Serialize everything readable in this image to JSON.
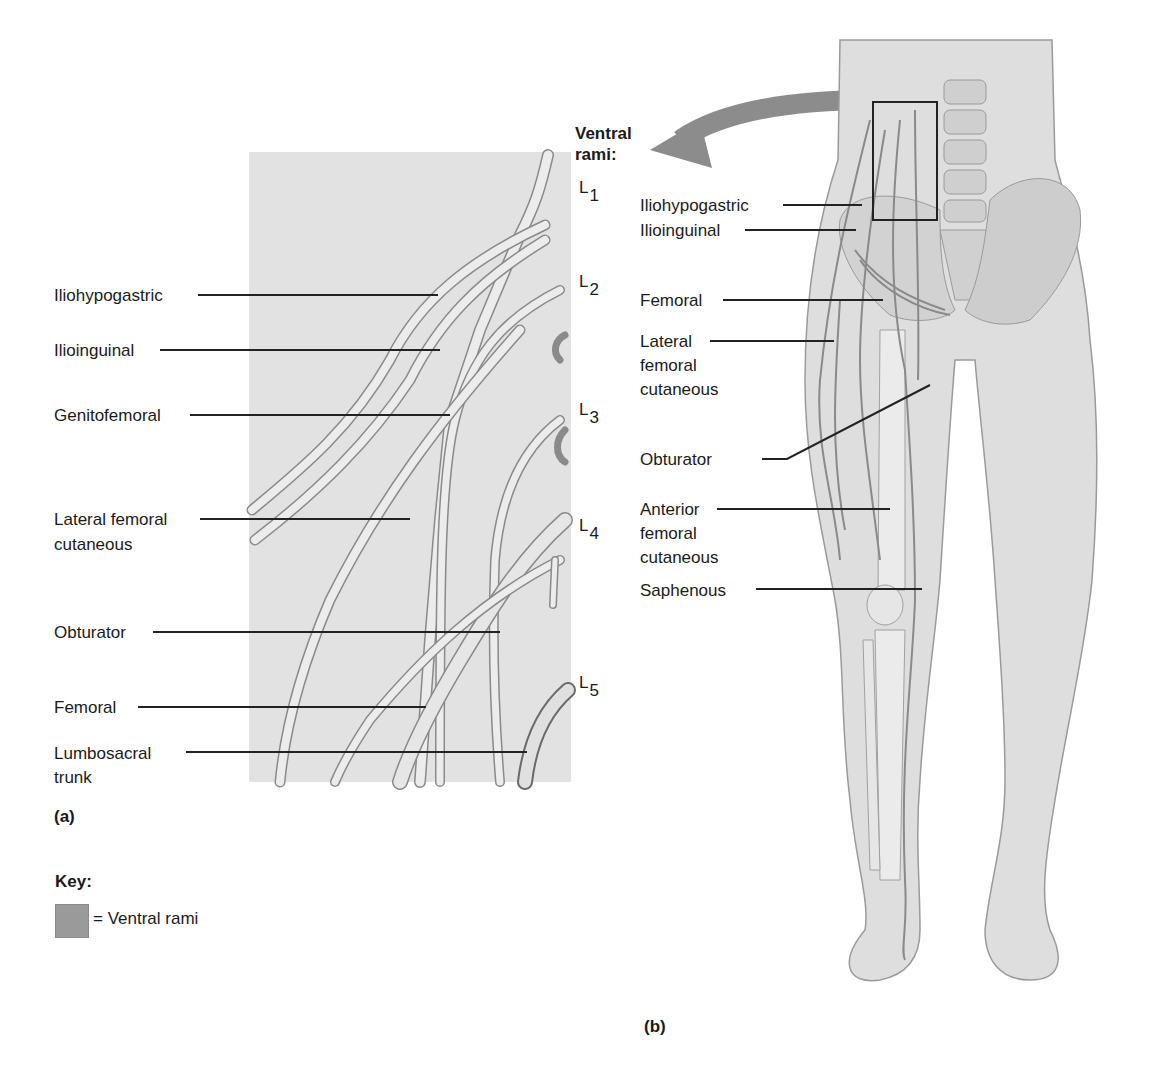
{
  "panel_a": {
    "caption": "(a)",
    "labels": [
      {
        "text": "Iliohypogastric"
      },
      {
        "text": "Ilioinguinal"
      },
      {
        "text": "Genitofemoral"
      },
      {
        "text": "Lateral femoral",
        "text2": "cutaneous"
      },
      {
        "text": "Obturator"
      },
      {
        "text": "Femoral"
      },
      {
        "text": "Lumbosacral",
        "text2": "trunk"
      }
    ],
    "segments": [
      "L",
      "1",
      "L",
      "2",
      "L",
      "3",
      "L",
      "4",
      "L",
      "5"
    ],
    "segment_list": [
      "L1",
      "L2",
      "L3",
      "L4",
      "L5"
    ]
  },
  "ventral_rami_heading": {
    "line1": "Ventral",
    "line2": "rami:"
  },
  "panel_b": {
    "caption": "(b)",
    "labels": [
      {
        "text": "Iliohypogastric"
      },
      {
        "text": "Ilioinguinal"
      },
      {
        "text": "Femoral"
      },
      {
        "text": "Lateral",
        "text2": "femoral",
        "text3": "cutaneous"
      },
      {
        "text": "Obturator"
      },
      {
        "text": "Anterior",
        "text2": "femoral",
        "text3": "cutaneous"
      },
      {
        "text": "Saphenous"
      }
    ]
  },
  "key": {
    "title": "Key:",
    "entry": "= Ventral rami",
    "swatch_color": "#9a9a9a"
  },
  "colors": {
    "panel_bg": "#e2e2e2",
    "body_fill": "#dcdcdc",
    "nerve_fill": "#ececec",
    "nerve_stroke": "#8a8a8a",
    "arrow": "#8c8c8c"
  }
}
